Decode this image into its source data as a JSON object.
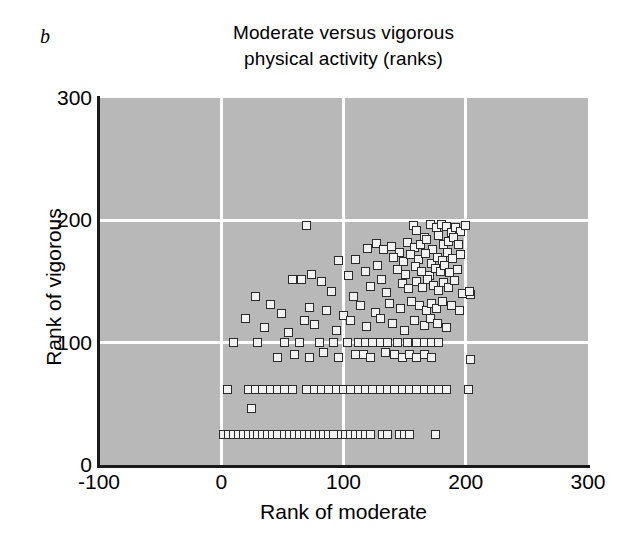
{
  "panel": {
    "label": "b"
  },
  "chart_data": {
    "type": "scatter",
    "title": "Moderate versus vigorous physical activity (ranks)",
    "title_lines": [
      "Moderate versus vigorous",
      "physical activity (ranks)"
    ],
    "xlabel": "Rank of moderate",
    "ylabel": "Rank of vigorous",
    "xlim": [
      -100,
      300
    ],
    "ylim": [
      0,
      300
    ],
    "xticks": [
      -100,
      0,
      100,
      200,
      300
    ],
    "yticks": [
      0,
      100,
      200,
      300
    ],
    "xtick_labels": [
      "-100",
      "0",
      "100",
      "200",
      "300"
    ],
    "ytick_labels": [
      "0",
      "100",
      "200",
      "300"
    ],
    "grid": true,
    "gridline_color": "#ffffff",
    "plot_background": "#b8b8b8",
    "marker_face_color": "#f2f2f2",
    "marker_edge_color": "#2b2b2b",
    "marker_shape": "square",
    "legend": null,
    "n_points": 238,
    "points": [
      [
        70,
        196
      ],
      [
        127,
        181
      ],
      [
        139,
        179
      ],
      [
        157,
        196
      ],
      [
        160,
        192
      ],
      [
        166,
        186
      ],
      [
        171,
        197
      ],
      [
        176,
        194
      ],
      [
        180,
        197
      ],
      [
        184,
        195
      ],
      [
        188,
        190
      ],
      [
        192,
        194
      ],
      [
        196,
        191
      ],
      [
        200,
        196
      ],
      [
        96,
        167
      ],
      [
        120,
        177
      ],
      [
        133,
        176
      ],
      [
        146,
        174
      ],
      [
        152,
        182
      ],
      [
        158,
        178
      ],
      [
        163,
        180
      ],
      [
        168,
        184
      ],
      [
        173,
        176
      ],
      [
        178,
        188
      ],
      [
        182,
        180
      ],
      [
        186,
        183
      ],
      [
        190,
        186
      ],
      [
        194,
        180
      ],
      [
        66,
        152
      ],
      [
        74,
        156
      ],
      [
        110,
        168
      ],
      [
        128,
        163
      ],
      [
        141,
        170
      ],
      [
        149,
        166
      ],
      [
        155,
        172
      ],
      [
        161,
        168
      ],
      [
        167,
        173
      ],
      [
        172,
        165
      ],
      [
        177,
        170
      ],
      [
        181,
        167
      ],
      [
        185,
        174
      ],
      [
        189,
        169
      ],
      [
        196,
        172
      ],
      [
        28,
        138
      ],
      [
        58,
        152
      ],
      [
        82,
        150
      ],
      [
        104,
        155
      ],
      [
        118,
        158
      ],
      [
        131,
        152
      ],
      [
        144,
        160
      ],
      [
        151,
        156
      ],
      [
        159,
        162
      ],
      [
        164,
        158
      ],
      [
        170,
        155
      ],
      [
        175,
        161
      ],
      [
        179,
        158
      ],
      [
        183,
        163
      ],
      [
        187,
        157
      ],
      [
        193,
        160
      ],
      [
        199,
        140
      ],
      [
        204,
        139
      ],
      [
        40,
        131
      ],
      [
        72,
        129
      ],
      [
        90,
        142
      ],
      [
        108,
        138
      ],
      [
        122,
        146
      ],
      [
        135,
        141
      ],
      [
        148,
        148
      ],
      [
        153,
        144
      ],
      [
        160,
        150
      ],
      [
        165,
        145
      ],
      [
        169,
        152
      ],
      [
        174,
        147
      ],
      [
        178,
        143
      ],
      [
        182,
        149
      ],
      [
        186,
        145
      ],
      [
        191,
        151
      ],
      [
        197,
        140
      ],
      [
        203,
        142
      ],
      [
        20,
        120
      ],
      [
        49,
        124
      ],
      [
        68,
        118
      ],
      [
        86,
        126
      ],
      [
        100,
        122
      ],
      [
        114,
        130
      ],
      [
        126,
        125
      ],
      [
        138,
        132
      ],
      [
        147,
        128
      ],
      [
        156,
        134
      ],
      [
        162,
        130
      ],
      [
        168,
        126
      ],
      [
        172,
        132
      ],
      [
        176,
        128
      ],
      [
        181,
        134
      ],
      [
        188,
        130
      ],
      [
        195,
        126
      ],
      [
        35,
        112
      ],
      [
        55,
        108
      ],
      [
        76,
        115
      ],
      [
        94,
        110
      ],
      [
        106,
        118
      ],
      [
        119,
        113
      ],
      [
        130,
        120
      ],
      [
        140,
        116
      ],
      [
        150,
        110
      ],
      [
        158,
        118
      ],
      [
        166,
        114
      ],
      [
        171,
        120
      ],
      [
        177,
        116
      ],
      [
        184,
        112
      ],
      [
        10,
        100
      ],
      [
        30,
        100
      ],
      [
        52,
        100
      ],
      [
        64,
        100
      ],
      [
        80,
        100
      ],
      [
        92,
        100
      ],
      [
        103,
        100
      ],
      [
        112,
        100
      ],
      [
        118,
        100
      ],
      [
        124,
        100
      ],
      [
        130,
        100
      ],
      [
        136,
        100
      ],
      [
        144,
        100
      ],
      [
        152,
        100
      ],
      [
        160,
        100
      ],
      [
        166,
        100
      ],
      [
        172,
        100
      ],
      [
        178,
        100
      ],
      [
        46,
        88
      ],
      [
        60,
        90
      ],
      [
        72,
        88
      ],
      [
        84,
        92
      ],
      [
        96,
        88
      ],
      [
        110,
        90
      ],
      [
        116,
        90
      ],
      [
        122,
        88
      ],
      [
        134,
        92
      ],
      [
        142,
        90
      ],
      [
        148,
        88
      ],
      [
        154,
        90
      ],
      [
        160,
        88
      ],
      [
        166,
        90
      ],
      [
        172,
        88
      ],
      [
        204,
        86
      ],
      [
        5,
        62
      ],
      [
        22,
        62
      ],
      [
        28,
        62
      ],
      [
        34,
        62
      ],
      [
        40,
        62
      ],
      [
        46,
        62
      ],
      [
        52,
        62
      ],
      [
        58,
        62
      ],
      [
        70,
        62
      ],
      [
        76,
        62
      ],
      [
        82,
        62
      ],
      [
        88,
        62
      ],
      [
        94,
        62
      ],
      [
        100,
        62
      ],
      [
        106,
        62
      ],
      [
        112,
        62
      ],
      [
        118,
        62
      ],
      [
        124,
        62
      ],
      [
        130,
        62
      ],
      [
        136,
        62
      ],
      [
        142,
        62
      ],
      [
        148,
        62
      ],
      [
        154,
        62
      ],
      [
        160,
        62
      ],
      [
        166,
        62
      ],
      [
        172,
        62
      ],
      [
        178,
        62
      ],
      [
        184,
        62
      ],
      [
        202,
        62
      ],
      [
        25,
        46
      ],
      [
        2,
        25
      ],
      [
        6,
        25
      ],
      [
        10,
        25
      ],
      [
        14,
        25
      ],
      [
        18,
        25
      ],
      [
        22,
        25
      ],
      [
        26,
        25
      ],
      [
        30,
        25
      ],
      [
        34,
        25
      ],
      [
        38,
        25
      ],
      [
        42,
        25
      ],
      [
        46,
        25
      ],
      [
        52,
        25
      ],
      [
        56,
        25
      ],
      [
        60,
        25
      ],
      [
        64,
        25
      ],
      [
        68,
        25
      ],
      [
        72,
        25
      ],
      [
        76,
        25
      ],
      [
        80,
        25
      ],
      [
        84,
        25
      ],
      [
        88,
        25
      ],
      [
        92,
        25
      ],
      [
        98,
        25
      ],
      [
        102,
        25
      ],
      [
        106,
        25
      ],
      [
        110,
        25
      ],
      [
        114,
        25
      ],
      [
        118,
        25
      ],
      [
        122,
        25
      ],
      [
        132,
        25
      ],
      [
        136,
        25
      ],
      [
        146,
        25
      ],
      [
        150,
        25
      ],
      [
        154,
        25
      ],
      [
        175,
        25
      ]
    ]
  }
}
